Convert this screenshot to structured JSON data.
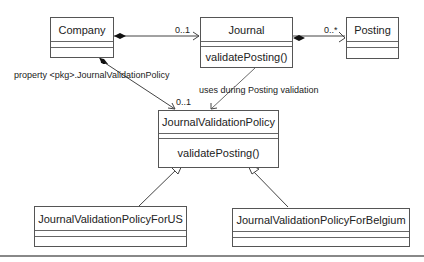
{
  "diagram": {
    "type": "uml-class-diagram",
    "classes": [
      {
        "id": "company",
        "name": "Company",
        "operations": []
      },
      {
        "id": "journal",
        "name": "Journal",
        "operations": [
          "validatePosting()"
        ]
      },
      {
        "id": "posting",
        "name": "Posting",
        "operations": []
      },
      {
        "id": "jvp",
        "name": "JournalValidationPolicy",
        "operations": [
          "validatePosting()"
        ]
      },
      {
        "id": "jvp_us",
        "name": "JournalValidationPolicyForUS",
        "operations": []
      },
      {
        "id": "jvp_be",
        "name": "JournalValidationPolicyForBelgium",
        "operations": []
      }
    ],
    "relations": [
      {
        "from": "company",
        "to": "journal",
        "kind": "composition",
        "multiplicity": "0..1"
      },
      {
        "from": "journal",
        "to": "posting",
        "kind": "composition",
        "multiplicity": "0..*"
      },
      {
        "from": "company",
        "to": "jvp",
        "kind": "composition",
        "label": "property <pkg>.JournalValidationPolicy",
        "multiplicity": "0..1"
      },
      {
        "from": "journal",
        "to": "jvp",
        "kind": "dependency",
        "label": "uses during Posting validation"
      },
      {
        "from": "jvp_us",
        "to": "jvp",
        "kind": "generalization"
      },
      {
        "from": "jvp_be",
        "to": "jvp",
        "kind": "generalization"
      }
    ],
    "labels": {
      "company_journal_mult": "0..1",
      "journal_posting_mult": "0..*",
      "company_jvp_label": "property <pkg>.JournalValidationPolicy",
      "company_jvp_mult": "0..1",
      "journal_jvp_label": "uses during Posting validation"
    }
  }
}
